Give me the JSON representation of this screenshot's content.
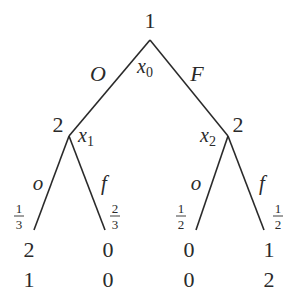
{
  "tree": {
    "root": {
      "player": "1",
      "node_label": "x",
      "node_sub": "0",
      "actions": {
        "left": "O",
        "right": "F"
      }
    },
    "left_node": {
      "player": "2",
      "node_label": "x",
      "node_sub": "1",
      "actions": {
        "left": "o",
        "right": "f"
      },
      "probs": [
        {
          "num": "1",
          "den": "3"
        },
        {
          "num": "2",
          "den": "3"
        }
      ]
    },
    "right_node": {
      "player": "2",
      "node_label": "x",
      "node_sub": "2",
      "actions": {
        "left": "o",
        "right": "f"
      },
      "probs": [
        {
          "num": "1",
          "den": "2"
        },
        {
          "num": "1",
          "den": "2"
        }
      ]
    },
    "payoffs": [
      {
        "p1": "2",
        "p2": "1"
      },
      {
        "p1": "0",
        "p2": "0"
      },
      {
        "p1": "0",
        "p2": "0"
      },
      {
        "p1": "1",
        "p2": "2"
      }
    ]
  }
}
